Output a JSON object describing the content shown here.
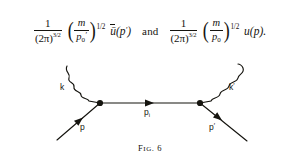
{
  "formula": {
    "left": {
      "fraction": {
        "numerator": "1",
        "denominator_base": "(2π)",
        "denominator_exponent": "3/2"
      },
      "paren_open": "(",
      "ratio_numerator": "m",
      "ratio_denominator": "p",
      "ratio_denominator_subscript": "0",
      "ratio_denominator_prime": "′",
      "paren_close": ")",
      "paren_exponent": "1/2",
      "spinor": "ū",
      "spinor_arg_open": "(",
      "spinor_arg": "p",
      "spinor_arg_prime": "′",
      "spinor_arg_close": ")"
    },
    "conjunction": "and",
    "right": {
      "fraction": {
        "numerator": "1",
        "denominator_base": "(2π)",
        "denominator_exponent": "3/2"
      },
      "paren_open": "(",
      "ratio_numerator": "m",
      "ratio_denominator": "p",
      "ratio_denominator_subscript": "0",
      "ratio_denominator_prime": "",
      "paren_close": ")",
      "paren_exponent": "1/2",
      "spinor": "u",
      "spinor_arg_open": "(",
      "spinor_arg": "p",
      "spinor_arg_prime": "",
      "spinor_arg_close": ")",
      "trailing_period": "."
    }
  },
  "diagram": {
    "line_color": "#15140f",
    "labels": {
      "incoming_photon": "k",
      "outgoing_photon": "k",
      "outgoing_photon_prime": "′",
      "incoming_fermion": "p",
      "internal_fermion": "p",
      "internal_fermion_subscript": "i",
      "outgoing_fermion": "p",
      "outgoing_fermion_prime": "′"
    },
    "vertices": [
      {
        "name": "left-vertex",
        "x": 100,
        "y": 51
      },
      {
        "name": "right-vertex",
        "x": 200,
        "y": 51
      }
    ]
  },
  "caption": {
    "prefix": "F",
    "rest": "IG",
    "number": ". 6"
  }
}
